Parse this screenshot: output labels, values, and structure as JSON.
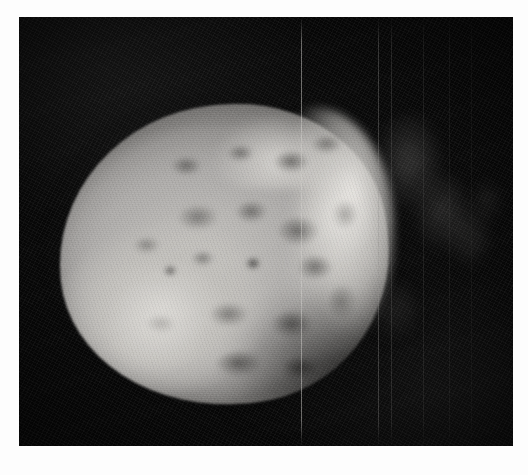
{
  "image": {
    "kind": "astronomical-photograph",
    "subject": "comet-nucleus",
    "caption": "",
    "color_mode": "grayscale",
    "background_color": "#070707",
    "frame": {
      "x": 19,
      "y": 17,
      "width": 494,
      "height": 429
    },
    "page_background": "#ffffff"
  },
  "palette": {
    "space_black": "#070707",
    "body_shadow": "#4a4947",
    "body_midtone": "#8e8c8a",
    "body_light": "#b4b2af",
    "body_highlight": "#d8d6d2",
    "limb_highlight": "#eceae6",
    "crater_dark": "#5c5b59"
  },
  "nucleus": {
    "label": "comet-nucleus-body",
    "shape": "irregular-rounded",
    "bounds": {
      "x": 40,
      "y": 88,
      "width": 330,
      "height": 300
    },
    "illumination": "lit from upper-right, terminator toward lower-right",
    "surface": "heavily pitted with shallow depressions and craters"
  },
  "craters": [
    {
      "name": "crater-upper-left",
      "x": 112,
      "y": 52,
      "w": 34,
      "h": 22,
      "tone": "rgba(58,57,55,0.58)"
    },
    {
      "name": "crater-upper-mid",
      "x": 168,
      "y": 40,
      "w": 30,
      "h": 20,
      "tone": "rgba(52,51,49,0.52)"
    },
    {
      "name": "crater-upper-right",
      "x": 214,
      "y": 46,
      "w": 40,
      "h": 26,
      "tone": "rgba(48,47,45,0.60)"
    },
    {
      "name": "crater-north-rim",
      "x": 252,
      "y": 30,
      "w": 34,
      "h": 22,
      "tone": "rgba(56,55,53,0.50)"
    },
    {
      "name": "crater-central-a",
      "x": 118,
      "y": 100,
      "w": 46,
      "h": 30,
      "tone": "rgba(62,61,59,0.50)"
    },
    {
      "name": "crater-central-b",
      "x": 176,
      "y": 96,
      "w": 36,
      "h": 26,
      "tone": "rgba(56,55,53,0.55)"
    },
    {
      "name": "crater-central-c",
      "x": 218,
      "y": 112,
      "w": 48,
      "h": 34,
      "tone": "rgba(48,47,45,0.58)"
    },
    {
      "name": "crater-mid-left",
      "x": 74,
      "y": 132,
      "w": 30,
      "h": 20,
      "tone": "rgba(70,69,67,0.45)"
    },
    {
      "name": "crater-mid-center",
      "x": 132,
      "y": 146,
      "w": 26,
      "h": 18,
      "tone": "rgba(60,59,57,0.50)"
    },
    {
      "name": "crater-small-dark",
      "x": 104,
      "y": 160,
      "w": 16,
      "h": 14,
      "tone": "rgba(40,39,37,0.62)"
    },
    {
      "name": "crater-deep-center",
      "x": 186,
      "y": 152,
      "w": 18,
      "h": 16,
      "tone": "rgba(34,33,31,0.70)"
    },
    {
      "name": "crater-right-ridge",
      "x": 238,
      "y": 150,
      "w": 40,
      "h": 30,
      "tone": "rgba(52,51,49,0.55)"
    },
    {
      "name": "crater-lower-mid",
      "x": 150,
      "y": 198,
      "w": 44,
      "h": 28,
      "tone": "rgba(58,57,55,0.50)"
    },
    {
      "name": "crater-lower-right",
      "x": 212,
      "y": 206,
      "w": 46,
      "h": 32,
      "tone": "rgba(44,43,41,0.58)"
    },
    {
      "name": "crater-lower-left",
      "x": 86,
      "y": 210,
      "w": 34,
      "h": 22,
      "tone": "rgba(74,73,71,0.42)"
    },
    {
      "name": "crater-south-rim",
      "x": 156,
      "y": 246,
      "w": 52,
      "h": 30,
      "tone": "rgba(40,39,37,0.56)"
    },
    {
      "name": "crater-south-east",
      "x": 222,
      "y": 252,
      "w": 42,
      "h": 26,
      "tone": "rgba(36,35,33,0.60)"
    },
    {
      "name": "crater-east-edge",
      "x": 268,
      "y": 180,
      "w": 34,
      "h": 40,
      "tone": "rgba(50,49,47,0.52)"
    },
    {
      "name": "crater-east-upper",
      "x": 272,
      "y": 96,
      "w": 30,
      "h": 34,
      "tone": "rgba(56,55,53,0.50)"
    }
  ],
  "highlights": [
    {
      "name": "highlight-southwest-lobe",
      "x": 36,
      "y": 168,
      "w": 120,
      "h": 110,
      "tone": "rgba(228,226,222,0.42)"
    },
    {
      "name": "highlight-limb-northeast",
      "x": 230,
      "y": 52,
      "w": 90,
      "h": 120,
      "tone": "rgba(238,236,232,0.45)"
    },
    {
      "name": "highlight-east-bright",
      "x": 258,
      "y": 150,
      "w": 64,
      "h": 90,
      "tone": "rgba(222,220,216,0.38)"
    }
  ],
  "jets": [
    {
      "name": "jet-upper-right",
      "x": 54,
      "y": 24,
      "w": 90,
      "h": 120,
      "tone": "rgba(150,148,146,0.30)"
    },
    {
      "name": "jet-east-spur",
      "x": 92,
      "y": 84,
      "w": 78,
      "h": 100,
      "tone": "rgba(140,138,136,0.26)"
    },
    {
      "name": "jet-far-east",
      "x": 126,
      "y": 120,
      "w": 60,
      "h": 78,
      "tone": "rgba(120,118,116,0.22)"
    },
    {
      "name": "jet-faint-tip",
      "x": 150,
      "y": 96,
      "w": 44,
      "h": 56,
      "tone": "rgba(110,108,106,0.18)"
    },
    {
      "name": "jet-lower-spur",
      "x": 48,
      "y": 190,
      "w": 70,
      "h": 80,
      "tone": "rgba(105,103,101,0.20)"
    }
  ],
  "seams": [
    {
      "name": "mosaic-seam-1",
      "x": 282,
      "tone": "rgba(208,206,202,0.50)"
    },
    {
      "name": "mosaic-seam-2",
      "x": 359,
      "tone": "rgba(150,148,146,0.34)"
    },
    {
      "name": "mosaic-seam-3",
      "x": 372,
      "tone": "rgba(120,118,116,0.26)"
    },
    {
      "name": "mosaic-seam-4",
      "x": 404,
      "tone": "rgba(96,95,93,0.22)"
    },
    {
      "name": "mosaic-seam-5",
      "x": 430,
      "tone": "rgba(80,79,77,0.18)"
    },
    {
      "name": "mosaic-seam-6",
      "x": 452,
      "tone": "rgba(70,69,67,0.16)"
    }
  ]
}
